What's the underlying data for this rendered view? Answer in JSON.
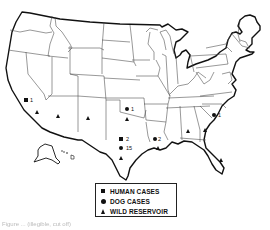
{
  "map": {
    "region": "United States",
    "markers": [
      {
        "type": "human_case",
        "label": "1",
        "location": "Southern California",
        "x": 26,
        "y": 100
      },
      {
        "type": "wild_reservoir",
        "location": "Southern California",
        "x": 37,
        "y": 112
      },
      {
        "type": "wild_reservoir",
        "location": "Arizona",
        "x": 58,
        "y": 116
      },
      {
        "type": "wild_reservoir",
        "location": "New Mexico",
        "x": 88,
        "y": 118
      },
      {
        "type": "dog_case",
        "label": "1",
        "location": "Oklahoma",
        "x": 127,
        "y": 109
      },
      {
        "type": "wild_reservoir",
        "location": "Oklahoma",
        "x": 127,
        "y": 119
      },
      {
        "type": "human_case",
        "label": "2",
        "location": "Texas",
        "x": 121,
        "y": 139
      },
      {
        "type": "dog_case",
        "label": "15",
        "location": "Texas",
        "x": 121,
        "y": 148
      },
      {
        "type": "wild_reservoir",
        "location": "Texas",
        "x": 121,
        "y": 158
      },
      {
        "type": "dog_case",
        "label": "2",
        "location": "Louisiana",
        "x": 155,
        "y": 139
      },
      {
        "type": "wild_reservoir",
        "location": "Louisiana",
        "x": 158,
        "y": 148
      },
      {
        "type": "wild_reservoir",
        "location": "Alabama",
        "x": 188,
        "y": 131
      },
      {
        "type": "wild_reservoir",
        "location": "Georgia",
        "x": 205,
        "y": 130
      },
      {
        "type": "dog_case",
        "label": "1",
        "location": "South Carolina",
        "x": 214,
        "y": 115
      },
      {
        "type": "wild_reservoir",
        "location": "Florida",
        "x": 221,
        "y": 160
      }
    ]
  },
  "legend": {
    "items": [
      {
        "symbol": "square",
        "label": "HUMAN CASES"
      },
      {
        "symbol": "circle",
        "label": "DOG CASES"
      },
      {
        "symbol": "triangle",
        "label": "WILD RESERVOIR"
      }
    ]
  },
  "labels": {
    "ca_human": "1",
    "ok_dog": "1",
    "tx_human": "2",
    "tx_dog": "15",
    "la_dog": "2",
    "sc_dog": "1"
  },
  "caption": "Figure ...  (illegible, cut off)"
}
